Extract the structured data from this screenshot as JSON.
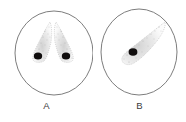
{
  "figure": {
    "background_color": "#ffffff",
    "outline_color": "#6e6e6e",
    "nucleus_color": "#100d0d",
    "stipple_color": "#b9b9b9",
    "label_color": "#3c3c3c"
  },
  "panels": [
    {
      "id": "A",
      "label": "A",
      "cell_shape": "circle",
      "cell_center_x": 54,
      "cell_center_y": 53,
      "cell_radius_x": 39,
      "cell_radius_y": 42,
      "inclusion_count": 2,
      "inclusion_description": "two mirrored tapered stippled bodies forming an inverted V",
      "nuclei": [
        {
          "cx": 38,
          "cy": 56,
          "rx": 4.2,
          "ry": 3.6
        },
        {
          "cx": 66,
          "cy": 56,
          "rx": 4.2,
          "ry": 3.6
        }
      ]
    },
    {
      "id": "B",
      "label": "B",
      "cell_shape": "oval",
      "cell_center_x": 46,
      "cell_center_y": 52,
      "cell_radius_x": 38,
      "cell_radius_y": 43,
      "inclusion_count": 1,
      "inclusion_description": "single comma shaped stippled body angled up to the right",
      "nuclei": [
        {
          "cx": 40,
          "cy": 52,
          "rx": 4.4,
          "ry": 3.8
        }
      ]
    }
  ],
  "labels": {
    "panel_a": "A",
    "panel_b": "B"
  }
}
